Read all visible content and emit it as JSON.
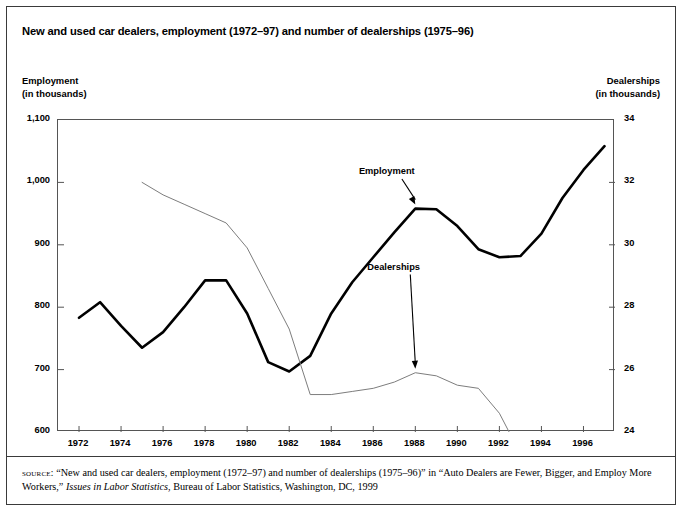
{
  "figure": {
    "title": "New and used car dealers, employment (1972–97) and number of dealerships (1975–96)",
    "left_axis_caption_line1": "Employment",
    "left_axis_caption_line2": "(in thousands)",
    "right_axis_caption_line1": "Dealerships",
    "right_axis_caption_line2": "(in thousands)",
    "source_label": "source:",
    "source_text_part1": "“New and used car dealers, employment (1972–97) and number of dealerships (1975–96)” in “Auto Dealers are Fewer, Bigger, and Employ More Workers,” ",
    "source_text_italic": "Issues in Labor Statistics",
    "source_text_part2": ", Bureau of Labor Statistics, Washington, DC, 1999"
  },
  "chart_data": {
    "type": "line",
    "title": "New and used car dealers, employment (1972–97) and number of dealerships (1975–96)",
    "xlabel": "",
    "ylabel": "Employment (in thousands)",
    "y2label": "Dealerships (in thousands)",
    "xlim": [
      1971,
      1997.5
    ],
    "ylim": [
      600,
      1100
    ],
    "y2lim": [
      24,
      34
    ],
    "grid": false,
    "legend_position": "inline-annotations",
    "x_ticks": [
      1972,
      1974,
      1976,
      1978,
      1980,
      1982,
      1984,
      1986,
      1988,
      1990,
      1992,
      1994,
      1996
    ],
    "x_tick_labels": [
      "1972",
      "1974",
      "1976",
      "1978",
      "1980",
      "1982",
      "1984",
      "1986",
      "1988",
      "1990",
      "1992",
      "1994",
      "1996"
    ],
    "y_ticks": [
      600,
      700,
      800,
      900,
      1000,
      1100
    ],
    "y_tick_labels": [
      "600",
      "700",
      "800",
      "900",
      "1,000",
      "1,100"
    ],
    "y2_ticks": [
      24,
      26,
      28,
      30,
      32,
      34
    ],
    "y2_tick_labels": [
      "24",
      "26",
      "28",
      "30",
      "32",
      "34"
    ],
    "series": [
      {
        "name": "Employment",
        "axis": "left",
        "color": "#000000",
        "line_width": 2.6,
        "x": [
          1972,
          1973,
          1974,
          1975,
          1976,
          1977,
          1978,
          1979,
          1980,
          1981,
          1982,
          1983,
          1984,
          1985,
          1986,
          1987,
          1988,
          1989,
          1990,
          1991,
          1992,
          1993,
          1994,
          1995,
          1996,
          1997
        ],
        "values": [
          783,
          808,
          770,
          735,
          760,
          800,
          843,
          843,
          790,
          712,
          697,
          722,
          790,
          840,
          880,
          920,
          958,
          957,
          930,
          893,
          880,
          882,
          918,
          975,
          1020,
          1058
        ]
      },
      {
        "name": "Dealerships",
        "axis": "right",
        "color": "#7d7d7d",
        "line_width": 1.0,
        "x": [
          1975,
          1976,
          1977,
          1978,
          1979,
          1980,
          1981,
          1982,
          1983,
          1984,
          1985,
          1986,
          1987,
          1988,
          1989,
          1990,
          1991,
          1992,
          1993,
          1994,
          1995,
          1996
        ],
        "values": [
          32.0,
          31.6,
          31.3,
          31.0,
          30.7,
          29.9,
          28.6,
          27.3,
          25.2,
          25.2,
          25.3,
          25.4,
          25.6,
          25.9,
          25.8,
          25.5,
          25.4,
          24.6,
          23.3,
          22.4,
          22.4,
          22.5
        ]
      }
    ],
    "annotations": [
      {
        "text": "Employment",
        "series": "Employment",
        "x": 1988,
        "label_pos": [
          1986.6,
          1015
        ]
      },
      {
        "text": "Dealerships",
        "series": "Dealerships",
        "x": 1988,
        "label_pos": [
          1987.0,
          862
        ]
      }
    ]
  }
}
